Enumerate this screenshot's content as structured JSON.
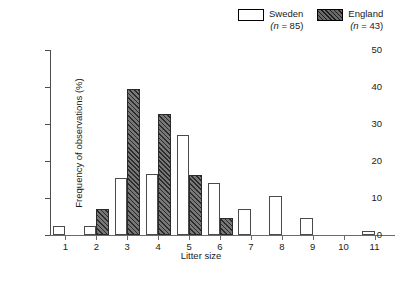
{
  "chart_data": {
    "type": "bar",
    "title": "",
    "xlabel": "Litter size",
    "ylabel": "Frequency of observations (%)",
    "categories": [
      "1",
      "2",
      "3",
      "4",
      "5",
      "6",
      "7",
      "8",
      "9",
      "10",
      "11"
    ],
    "yticks": [
      "0",
      "10",
      "20",
      "30",
      "40",
      "50"
    ],
    "ylim": [
      0,
      50
    ],
    "grid": false,
    "legend_position": "top-right",
    "series": [
      {
        "name": "Sweden",
        "n_label": "(n = 85)",
        "n": 85,
        "pattern": "open",
        "values": [
          2.4,
          2.4,
          15.3,
          16.5,
          27.1,
          14.1,
          7.1,
          10.6,
          4.7,
          0,
          1.2
        ]
      },
      {
        "name": "England",
        "n_label": "(n = 43)",
        "n": 43,
        "pattern": "hatched",
        "values": [
          0,
          7.0,
          39.5,
          32.6,
          16.3,
          4.7,
          0,
          0,
          0,
          0,
          0
        ]
      }
    ]
  },
  "legend": {
    "items": [
      {
        "label": "Sweden",
        "sub": "(n = 85)",
        "swatch": "open-swatch"
      },
      {
        "label": "England",
        "sub": "(n = 43)",
        "swatch": "hatched-swatch"
      }
    ]
  },
  "colors": {
    "axis": "#4d4d4d",
    "sweden_fill": "#ffffff",
    "england_fill": "#6a6a6a",
    "hatch": "#2b2b2b"
  }
}
